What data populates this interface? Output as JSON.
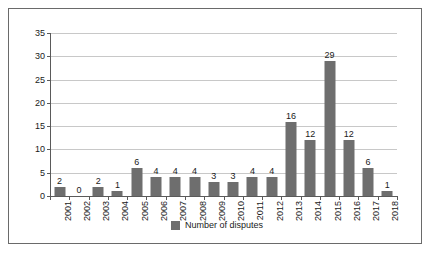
{
  "chart_data": {
    "type": "bar",
    "title": "",
    "xlabel": "",
    "ylabel": "",
    "categories": [
      "2001",
      "2002",
      "2003",
      "2004",
      "2005",
      "2006",
      "2007",
      "2008",
      "2009",
      "2010",
      "2011",
      "2012",
      "2013",
      "2014",
      "2015",
      "2016",
      "2017",
      "2018"
    ],
    "values": [
      2,
      0,
      2,
      1,
      6,
      4,
      4,
      4,
      3,
      3,
      4,
      4,
      16,
      12,
      29,
      12,
      6,
      1
    ],
    "series": [
      {
        "name": "Number of disputes",
        "values": [
          2,
          0,
          2,
          1,
          6,
          4,
          4,
          4,
          3,
          3,
          4,
          4,
          16,
          12,
          29,
          12,
          6,
          1
        ]
      }
    ],
    "ylim": [
      0,
      35
    ],
    "ytick_labels": [
      "0",
      "5",
      "10",
      "15",
      "20",
      "25",
      "30",
      "35"
    ],
    "ytick_values": [
      0,
      5,
      10,
      15,
      20,
      25,
      30,
      35
    ],
    "grid": true,
    "legend_position": "bottom",
    "show_data_labels": true,
    "bar_color": "#6e6e6e",
    "gridline_color": "#c8c8c8",
    "axis_color": "#5a5a5a",
    "frame_color": "#6a6a6a",
    "background_color": "#ffffff"
  },
  "legend": {
    "entries": [
      {
        "label": "Number of disputes",
        "color": "#6e6e6e"
      }
    ]
  }
}
